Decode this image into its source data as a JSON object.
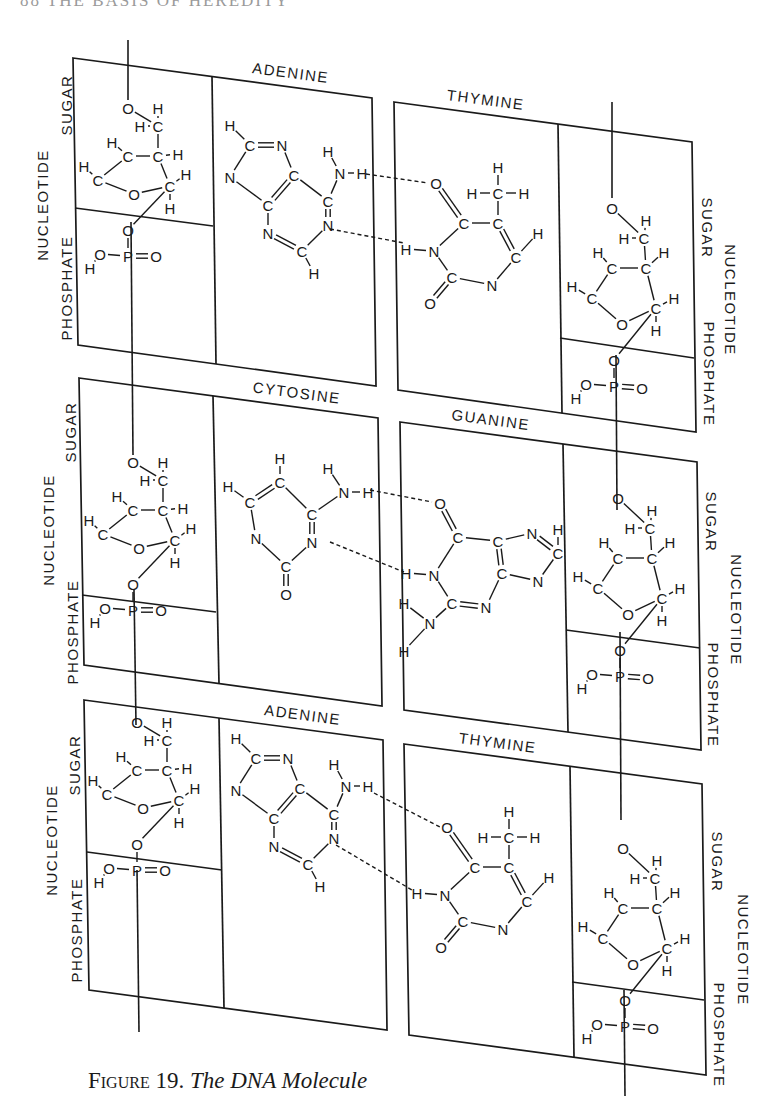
{
  "page": {
    "running_head": "88   THE BASIS OF HEREDITY",
    "background": "#ffffff",
    "ink": "#1a1a1a"
  },
  "caption": {
    "figure_label": "Figure 19.",
    "title": "The DNA Molecule"
  },
  "labels": {
    "nucleotide": "NUCLEOTIDE",
    "sugar": "SUGAR",
    "phosphate": "PHOSPHATE"
  },
  "base_pairs": [
    {
      "left_base": "ADENINE",
      "right_base": "THYMINE",
      "hydrogen_bonds": 2
    },
    {
      "left_base": "CYTOSINE",
      "right_base": "GUANINE",
      "hydrogen_bonds": 2
    },
    {
      "left_base": "ADENINE",
      "right_base": "THYMINE",
      "hydrogen_bonds": 2
    }
  ],
  "diagram": {
    "panels": [
      {
        "id": "left-1",
        "side": "left",
        "base": "ADENINE",
        "quad": [
          [
            73,
            58
          ],
          [
            372,
            98
          ],
          [
            376,
            386
          ],
          [
            78,
            345
          ]
        ],
        "divider_x": [
          212,
          216
        ],
        "sugar_phosphate_split": [
          [
            75,
            208
          ],
          [
            213,
            226
          ]
        ],
        "label_pos": [
          290,
          78
        ],
        "label_angle": 7.5
      },
      {
        "id": "right-1",
        "side": "right",
        "base": "THYMINE",
        "quad": [
          [
            394,
            102
          ],
          [
            692,
            142
          ],
          [
            696,
            432
          ],
          [
            398,
            390
          ]
        ],
        "divider_x": [
          558,
          562
        ],
        "sugar_phosphate_split": [
          [
            560,
            338
          ],
          [
            694,
            358
          ]
        ],
        "label_pos": [
          485,
          105
        ],
        "label_angle": 7.5
      },
      {
        "id": "left-2",
        "side": "left",
        "base": "CYTOSINE",
        "quad": [
          [
            79,
            378
          ],
          [
            378,
            418
          ],
          [
            382,
            706
          ],
          [
            84,
            665
          ]
        ],
        "divider_x": [
          213,
          219
        ],
        "sugar_phosphate_split": [
          [
            82,
            595
          ],
          [
            216,
            612
          ]
        ],
        "label_pos": [
          296,
          398
        ],
        "label_angle": 7.5
      },
      {
        "id": "right-2",
        "side": "right",
        "base": "GUANINE",
        "quad": [
          [
            400,
            422
          ],
          [
            697,
            462
          ],
          [
            701,
            750
          ],
          [
            404,
            710
          ]
        ],
        "divider_x": [
          563,
          568
        ],
        "sugar_phosphate_split": [
          [
            566,
            630
          ],
          [
            700,
            648
          ]
        ],
        "label_pos": [
          490,
          425
        ],
        "label_angle": 7.5
      },
      {
        "id": "left-3",
        "side": "left",
        "base": "ADENINE",
        "quad": [
          [
            84,
            700
          ],
          [
            383,
            740
          ],
          [
            387,
            1030
          ],
          [
            89,
            990
          ]
        ],
        "divider_x": [
          219,
          224
        ],
        "sugar_phosphate_split": [
          [
            87,
            852
          ],
          [
            222,
            870
          ]
        ],
        "label_pos": [
          302,
          720
        ],
        "label_angle": 7.5
      },
      {
        "id": "right-3",
        "side": "right",
        "base": "THYMINE",
        "quad": [
          [
            404,
            744
          ],
          [
            702,
            784
          ],
          [
            706,
            1075
          ],
          [
            409,
            1035
          ]
        ],
        "divider_x": [
          570,
          574
        ],
        "sugar_phosphate_split": [
          [
            572,
            982
          ],
          [
            704,
            1000
          ]
        ],
        "label_pos": [
          497,
          748
        ],
        "label_angle": 7.5
      }
    ],
    "backbones": [
      [
        [
          128,
          40
        ],
        [
          128,
          100
        ]
      ],
      [
        [
          131,
          222
        ],
        [
          133,
          455
        ]
      ],
      [
        [
          134,
          590
        ],
        [
          136,
          725
        ]
      ],
      [
        [
          137,
          870
        ],
        [
          139,
          1032
        ]
      ],
      [
        [
          612,
          102
        ],
        [
          612,
          198
        ]
      ],
      [
        [
          616,
          355
        ],
        [
          617,
          510
        ]
      ],
      [
        [
          620,
          632
        ],
        [
          621,
          820
        ]
      ],
      [
        [
          624,
          990
        ],
        [
          625,
          1096
        ]
      ]
    ],
    "side_labels": [
      {
        "text_key": "nucleotide",
        "x": 44,
        "y": 205,
        "rot": -90
      },
      {
        "text_key": "sugar",
        "x": 68,
        "y": 105,
        "rot": -90
      },
      {
        "text_key": "phosphate",
        "x": 68,
        "y": 288,
        "rot": -90
      },
      {
        "text_key": "nucleotide",
        "x": 729,
        "y": 300,
        "rot": 90
      },
      {
        "text_key": "sugar",
        "x": 706,
        "y": 228,
        "rot": 90
      },
      {
        "text_key": "phosphate",
        "x": 708,
        "y": 374,
        "rot": 90
      },
      {
        "text_key": "nucleotide",
        "x": 50,
        "y": 530,
        "rot": -90
      },
      {
        "text_key": "sugar",
        "x": 72,
        "y": 432,
        "rot": -90
      },
      {
        "text_key": "phosphate",
        "x": 74,
        "y": 632,
        "rot": -90
      },
      {
        "text_key": "nucleotide",
        "x": 735,
        "y": 610,
        "rot": 90
      },
      {
        "text_key": "sugar",
        "x": 710,
        "y": 522,
        "rot": 90
      },
      {
        "text_key": "phosphate",
        "x": 712,
        "y": 695,
        "rot": 90
      },
      {
        "text_key": "nucleotide",
        "x": 53,
        "y": 840,
        "rot": -90
      },
      {
        "text_key": "sugar",
        "x": 76,
        "y": 765,
        "rot": -90
      },
      {
        "text_key": "phosphate",
        "x": 78,
        "y": 930,
        "rot": -90
      },
      {
        "text_key": "nucleotide",
        "x": 742,
        "y": 950,
        "rot": 90
      },
      {
        "text_key": "sugar",
        "x": 716,
        "y": 862,
        "rot": 90
      },
      {
        "text_key": "phosphate",
        "x": 718,
        "y": 1035,
        "rot": 90
      }
    ]
  }
}
